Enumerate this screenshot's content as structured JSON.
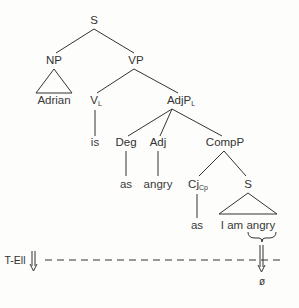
{
  "tree": {
    "root": {
      "label": "S"
    },
    "np": {
      "label": "NP",
      "leaf": "Adrian"
    },
    "vp": {
      "label": "VP"
    },
    "v": {
      "label": "V",
      "sub": "L",
      "leaf": "is"
    },
    "adjp": {
      "label": "AdjP",
      "sub": "L"
    },
    "deg": {
      "label": "Deg",
      "leaf": "as"
    },
    "adj": {
      "label": "Adj",
      "leaf": "angry"
    },
    "compp": {
      "label": "CompP"
    },
    "cj": {
      "label": "Cj",
      "sub": "Cp",
      "leaf": "as"
    },
    "s2": {
      "label": "S",
      "leaf": "I am angry"
    }
  },
  "transformation": {
    "label": "T-Ell",
    "result": "ø"
  },
  "colors": {
    "ink": "#333333",
    "background": "#fdfdfb"
  }
}
